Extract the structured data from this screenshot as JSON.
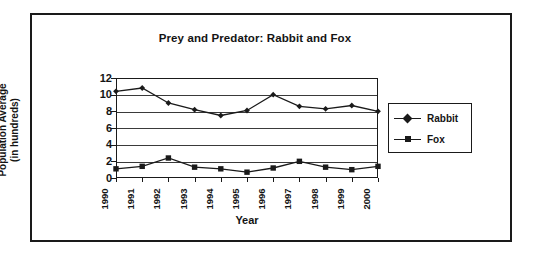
{
  "figure": {
    "title": "Prey and Predator: Rabbit and Fox",
    "x_axis_title": "Year",
    "y_axis_title_line1": "Population Average",
    "y_axis_title_line2": "(in hundreds)",
    "frame_color": "#1a1a1a",
    "background": "#ffffff",
    "series_color": "#1a1a1a"
  },
  "legend": {
    "position": "right",
    "entries": [
      {
        "label": "Rabbit",
        "marker": "diamond-marker"
      },
      {
        "label": "Fox",
        "marker": "square-marker"
      }
    ]
  },
  "chart_data": {
    "type": "line",
    "title": "Prey and Predator: Rabbit and Fox",
    "xlabel": "Year",
    "ylabel": "Population Average (in hundreds)",
    "categories": [
      "1990",
      "1991",
      "1992",
      "1993",
      "1994",
      "1995",
      "1996",
      "1997",
      "1998",
      "1999",
      "2000"
    ],
    "x": [
      1990,
      1991,
      1992,
      1993,
      1994,
      1995,
      1996,
      1997,
      1998,
      1999,
      2000
    ],
    "ylim": [
      0,
      12
    ],
    "xlim": [
      1990,
      2000
    ],
    "yticks": [
      0,
      2,
      4,
      6,
      8,
      10,
      12
    ],
    "ytick_labels": [
      "0",
      "2",
      "4",
      "6",
      "8",
      "10",
      "12"
    ],
    "grid": "horizontal",
    "legend_position": "right",
    "series": [
      {
        "name": "Rabbit",
        "marker": "diamond",
        "values": [
          10.4,
          10.8,
          9.0,
          8.2,
          7.5,
          8.1,
          10.0,
          8.6,
          8.3,
          8.7,
          8.0
        ]
      },
      {
        "name": "Fox",
        "marker": "square",
        "values": [
          1.1,
          1.4,
          2.4,
          1.3,
          1.1,
          0.7,
          1.2,
          2.0,
          1.3,
          1.0,
          1.4
        ]
      }
    ]
  }
}
